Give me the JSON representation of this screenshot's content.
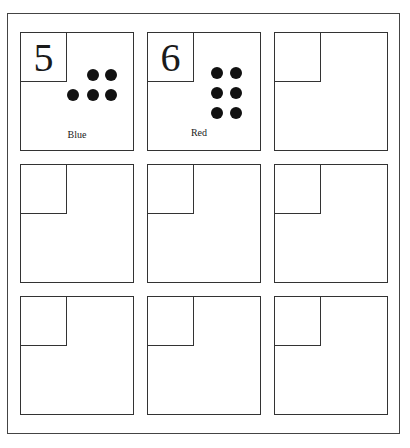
{
  "worksheet": {
    "cards": [
      {
        "number": "5",
        "dots": 5,
        "label": "Blue"
      },
      {
        "number": "6",
        "dots": 6,
        "label": "Red"
      },
      {
        "number": "",
        "dots": 0,
        "label": ""
      },
      {
        "number": "",
        "dots": 0,
        "label": ""
      },
      {
        "number": "",
        "dots": 0,
        "label": ""
      },
      {
        "number": "",
        "dots": 0,
        "label": ""
      },
      {
        "number": "",
        "dots": 0,
        "label": ""
      },
      {
        "number": "",
        "dots": 0,
        "label": ""
      },
      {
        "number": "",
        "dots": 0,
        "label": ""
      }
    ],
    "caption": ""
  }
}
